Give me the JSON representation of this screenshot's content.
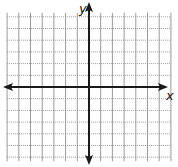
{
  "diagram": {
    "type": "coordinate-plane",
    "x_axis_label": "x",
    "y_axis_label": "y",
    "grid": {
      "spacing_px": 11.7,
      "vertical_style": "solid",
      "horizontal_style": "dotted",
      "columns_left_of_y_axis": 7,
      "columns_right_of_y_axis": 7,
      "rows_above_x_axis": 6,
      "rows_below_x_axis": 6
    },
    "axes": {
      "x_axis_arrows": "both",
      "y_axis_arrows": "both"
    },
    "colors": {
      "grid": "#9a9a9a",
      "axis": "#1a1a1a",
      "background": "#ffffff"
    }
  }
}
